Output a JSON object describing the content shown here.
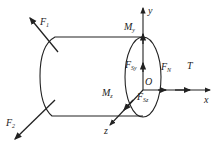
{
  "diagram": {
    "type": "shaft free-body diagram (cylinder with coordinate axes)",
    "colors": {
      "stroke": "#222222",
      "background": "#ffffff"
    },
    "labels": {
      "F1": {
        "main": "F",
        "sub": "1"
      },
      "F2": {
        "main": "F",
        "sub": "2"
      },
      "My": {
        "main": "M",
        "sub": "y"
      },
      "Mz": {
        "main": "M",
        "sub": "z"
      },
      "FSy": {
        "main": "F",
        "sub": "Sy"
      },
      "FSz": {
        "main": "F",
        "sub": "Sz"
      },
      "FN": {
        "main": "F",
        "sub": "N"
      },
      "T": "T",
      "O": "O",
      "x": "x",
      "y": "y",
      "z": "z"
    }
  }
}
